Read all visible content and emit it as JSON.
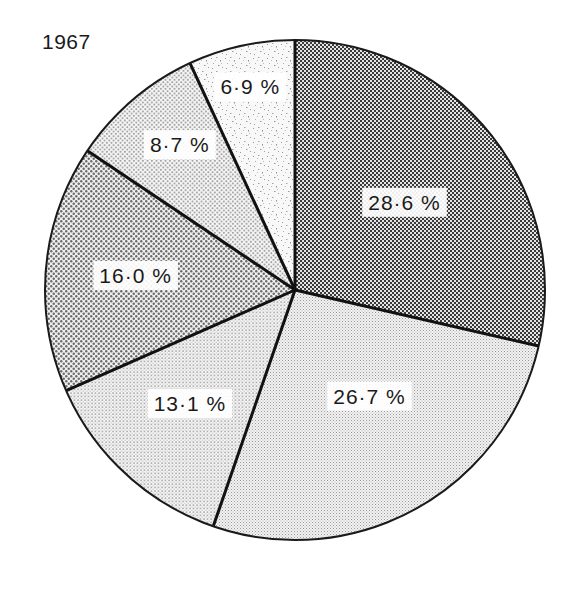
{
  "chart_data": {
    "type": "pie",
    "title": "1967",
    "start_angle_deg": 0,
    "direction": "clockwise",
    "legend": null,
    "slices": [
      {
        "label": "28·6 %",
        "value": 28.6,
        "pattern": "dense-checker",
        "color": "#4a4a4a"
      },
      {
        "label": "26·7 %",
        "value": 26.7,
        "pattern": "fine-hatch",
        "color": "#d8d8d8"
      },
      {
        "label": "13·1 %",
        "value": 13.1,
        "pattern": "fine-dots",
        "color": "#cfcfcf"
      },
      {
        "label": "16·0 %",
        "value": 16.0,
        "pattern": "medium-checker",
        "color": "#8a8a8a"
      },
      {
        "label": "8·7 %",
        "value": 8.7,
        "pattern": "dots",
        "color": "#bdbdbd"
      },
      {
        "label": "6·9 %",
        "value": 6.9,
        "pattern": "speckle",
        "color": "#e6e6e6"
      }
    ],
    "values": [
      28.6,
      26.7,
      13.1,
      16.0,
      8.7,
      6.9
    ],
    "categories": [
      "28·6 %",
      "26·7 %",
      "13·1 %",
      "16·0 %",
      "8·7 %",
      "6·9 %"
    ]
  },
  "header": {
    "title": "1967"
  }
}
